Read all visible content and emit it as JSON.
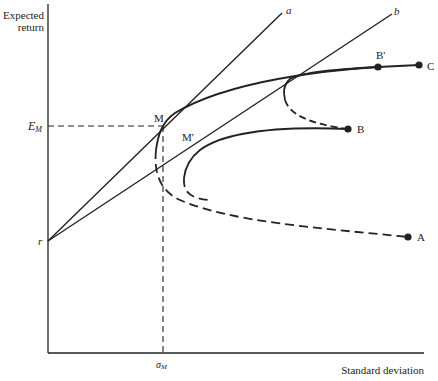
{
  "axes": {
    "y_label_line1": "Expected",
    "y_label_line2": "return",
    "x_label": "Standard deviation",
    "y_tick_label": "E",
    "y_tick_sub": "M",
    "x_tick_label": "σ",
    "x_tick_sub": "M",
    "origin_label": "r"
  },
  "lines": {
    "a_label": "a",
    "b_label": "b"
  },
  "points": {
    "M": "M",
    "M_prime": "M'",
    "A": "A",
    "B": "B",
    "B_prime": "B'",
    "C": "C"
  },
  "colors": {
    "ink": "#222222",
    "background": "#ffffff"
  }
}
